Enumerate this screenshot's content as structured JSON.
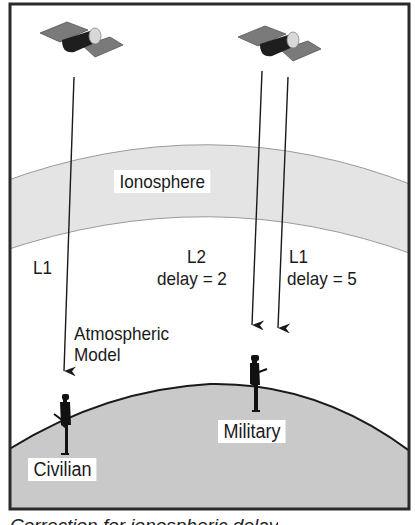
{
  "figure": {
    "labels": {
      "ionosphere": "Ionosphere",
      "civilian_signal": "L1",
      "atmospheric_model_line1": "Atmospheric",
      "atmospheric_model_line2": "Model",
      "l2_signal": "L2",
      "l2_delay": "delay = 2",
      "l1_signal": "L1",
      "l1_delay": "delay = 5",
      "civilian_receiver": "Civilian",
      "military_receiver": "Military"
    },
    "caption_partial": "Correction for ionospheric delay",
    "colors": {
      "frame": "#2a2a2a",
      "ionosphere_fill": "#e4e4e4",
      "earth_fill": "#c9c9c9",
      "solar_panel": "#7a7a7a",
      "satellite_body": "#1e1e1e",
      "dish": "#d8d8d8",
      "figure": "#111111"
    }
  }
}
